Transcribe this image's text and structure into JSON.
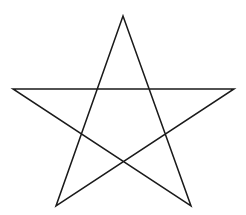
{
  "diagram": {
    "shape": "pentagram",
    "stroke_color": "#1a1a1a",
    "background_color": "#ffffff",
    "stroke_width": 1.5,
    "vertices": {
      "top": [
        123,
        16
      ],
      "right": [
        234,
        89
      ],
      "bottom_right": [
        191,
        206
      ],
      "bottom_left": [
        56,
        206
      ],
      "left": [
        13,
        89
      ]
    },
    "path_order": [
      "top",
      "bottom_left",
      "right",
      "left",
      "bottom_right",
      "top"
    ]
  }
}
